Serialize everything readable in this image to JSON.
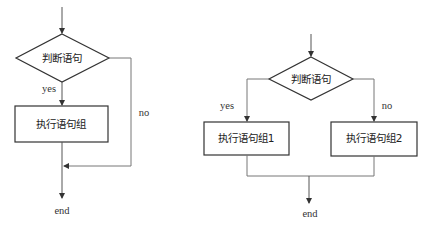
{
  "diagrams": {
    "single_branch": {
      "decision": "判断语句",
      "yes_label": "yes",
      "no_label": "no",
      "process": "执行语句组",
      "end": "end"
    },
    "double_branch": {
      "decision": "判断语句",
      "yes_label": "yes",
      "no_label": "no",
      "process_yes": "执行语句组1",
      "process_no": "执行语句组2",
      "end": "end"
    }
  },
  "colors": {
    "stroke_shape": "#333333",
    "stroke_line": "#777777",
    "text": "#222222"
  }
}
